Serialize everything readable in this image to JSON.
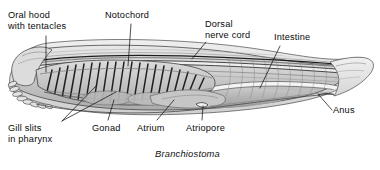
{
  "figure": {
    "title_caption": "Branchiostoma",
    "background_color": "#ffffff",
    "ink_color": "#111111",
    "organism": "lancelet lateral view",
    "labels": [
      {
        "id": "oral-hood",
        "text": "Oral hood\nwith tentacles",
        "x": 8,
        "y": 10,
        "align": "left"
      },
      {
        "id": "notochord",
        "text": "Notochord",
        "x": 105,
        "y": 10,
        "align": "left"
      },
      {
        "id": "dorsal-nerve-cord",
        "text": "Dorsal\nnerve cord",
        "x": 205,
        "y": 19,
        "align": "left"
      },
      {
        "id": "intestine",
        "text": "Intestine",
        "x": 274,
        "y": 32,
        "align": "left"
      },
      {
        "id": "anus",
        "text": "Anus",
        "x": 333,
        "y": 105,
        "align": "left"
      },
      {
        "id": "atriopore",
        "text": "Atriopore",
        "x": 186,
        "y": 123,
        "align": "left"
      },
      {
        "id": "atrium",
        "text": "Atrium",
        "x": 137,
        "y": 123,
        "align": "left"
      },
      {
        "id": "gonad",
        "text": "Gonad",
        "x": 92,
        "y": 123,
        "align": "left"
      },
      {
        "id": "gill-slits",
        "text": "Gill slits\nin pharynx",
        "x": 8,
        "y": 123,
        "align": "left"
      }
    ],
    "caption_position": {
      "x": 155,
      "y": 150
    }
  }
}
